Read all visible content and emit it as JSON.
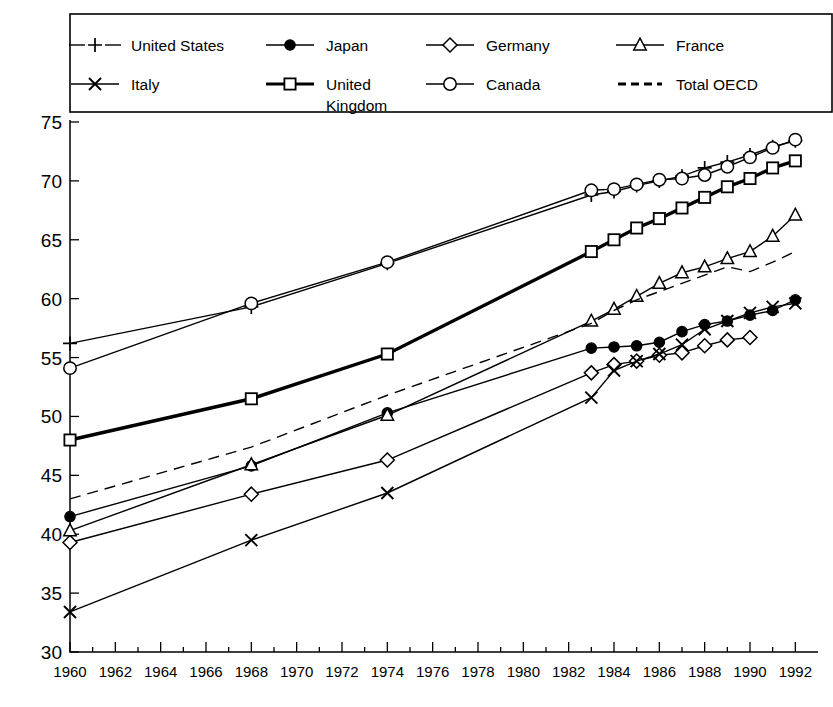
{
  "chart_data": {
    "type": "line",
    "title": "",
    "subtitle": "",
    "xlabel": "",
    "ylabel": "",
    "xlim": [
      1960,
      1993
    ],
    "ylim": [
      30,
      75
    ],
    "grid": false,
    "legend_position": "top",
    "y_ticks": [
      30,
      35,
      40,
      45,
      50,
      55,
      60,
      65,
      70,
      75
    ],
    "x_ticks": [
      1960,
      1962,
      1964,
      1966,
      1968,
      1970,
      1972,
      1974,
      1976,
      1978,
      1980,
      1982,
      1984,
      1986,
      1988,
      1990,
      1992
    ],
    "x_minor_ticks": [
      1961,
      1963,
      1965,
      1967,
      1969,
      1971,
      1973,
      1975,
      1977,
      1979,
      1981,
      1983,
      1985,
      1987,
      1989,
      1991
    ],
    "series": [
      {
        "name": "United States",
        "marker": "plus",
        "dash": "dashed-legend",
        "x": [
          1960,
          1968,
          1974,
          1983,
          1984,
          1985,
          1986,
          1987,
          1988,
          1989,
          1990,
          1991,
          1992
        ],
        "values": [
          56.2,
          59.3,
          63.0,
          68.8,
          69.1,
          69.6,
          70.0,
          70.4,
          71.1,
          71.6,
          72.2,
          72.9,
          73.4
        ]
      },
      {
        "name": "Japan",
        "marker": "filled-circle",
        "dash": "solid",
        "x": [
          1960,
          1968,
          1974,
          1983,
          1984,
          1985,
          1986,
          1987,
          1988,
          1989,
          1990,
          1991,
          1992
        ],
        "values": [
          41.5,
          45.8,
          50.3,
          55.8,
          55.9,
          56.0,
          56.3,
          57.2,
          57.8,
          58.1,
          58.6,
          59.0,
          59.9
        ]
      },
      {
        "name": "Germany",
        "marker": "diamond",
        "dash": "solid",
        "x": [
          1960,
          1968,
          1974,
          1983,
          1984,
          1985,
          1986,
          1987,
          1988,
          1989,
          1990
        ],
        "values": [
          39.3,
          43.4,
          46.3,
          53.7,
          54.4,
          54.7,
          55.2,
          55.4,
          56.0,
          56.5,
          56.7
        ]
      },
      {
        "name": "France",
        "marker": "triangle",
        "dash": "solid",
        "x": [
          1960,
          1968,
          1974,
          1983,
          1984,
          1985,
          1986,
          1987,
          1988,
          1989,
          1990,
          1991,
          1992
        ],
        "values": [
          40.3,
          45.9,
          50.1,
          58.1,
          59.1,
          60.2,
          61.3,
          62.2,
          62.7,
          63.4,
          64.0,
          65.3,
          67.1
        ]
      },
      {
        "name": "Italy",
        "marker": "cross",
        "dash": "solid",
        "x": [
          1960,
          1968,
          1974,
          1983,
          1984,
          1985,
          1986,
          1987,
          1988,
          1989,
          1990,
          1991,
          1992
        ],
        "values": [
          33.4,
          39.5,
          43.5,
          51.6,
          53.9,
          54.7,
          55.3,
          56.1,
          57.4,
          58.1,
          58.8,
          59.3,
          59.6
        ]
      },
      {
        "name": "United Kingdom",
        "marker": "square",
        "dash": "solid-bold",
        "x": [
          1960,
          1968,
          1974,
          1983,
          1984,
          1985,
          1986,
          1987,
          1988,
          1989,
          1990,
          1991,
          1992
        ],
        "values": [
          48.0,
          51.5,
          55.3,
          64.0,
          65.0,
          66.0,
          66.8,
          67.7,
          68.6,
          69.5,
          70.2,
          71.1,
          71.7
        ]
      },
      {
        "name": "Canada",
        "marker": "circle",
        "dash": "solid",
        "x": [
          1960,
          1968,
          1974,
          1983,
          1984,
          1985,
          1986,
          1987,
          1988,
          1989,
          1990,
          1991,
          1992
        ],
        "values": [
          54.1,
          59.6,
          63.1,
          69.2,
          69.3,
          69.7,
          70.1,
          70.2,
          70.5,
          71.2,
          72.0,
          72.8,
          73.5
        ]
      },
      {
        "name": "Total OECD",
        "marker": "none",
        "dash": "dashed",
        "x": [
          1960,
          1968,
          1974,
          1983,
          1984,
          1985,
          1986,
          1987,
          1988,
          1989,
          1990,
          1991,
          1992
        ],
        "values": [
          43.0,
          47.4,
          51.8,
          57.9,
          59.0,
          59.9,
          60.6,
          61.3,
          62.0,
          62.7,
          62.3,
          63.1,
          64.0
        ]
      }
    ]
  },
  "legend": {
    "rows": [
      [
        {
          "label": "United States",
          "marker": "plus",
          "style": "dashed"
        },
        {
          "label": "Japan",
          "marker": "filled-circle",
          "style": "solid"
        },
        {
          "label": "Germany",
          "marker": "diamond",
          "style": "solid"
        },
        {
          "label": "France",
          "marker": "triangle",
          "style": "solid"
        }
      ],
      [
        {
          "label": "Italy",
          "marker": "cross",
          "style": "solid"
        },
        {
          "label": "United\nKingdom",
          "marker": "square",
          "style": "solid-bold"
        },
        {
          "label": "Canada",
          "marker": "circle",
          "style": "solid"
        },
        {
          "label": "Total OECD",
          "marker": "none",
          "style": "dashed"
        }
      ]
    ]
  }
}
